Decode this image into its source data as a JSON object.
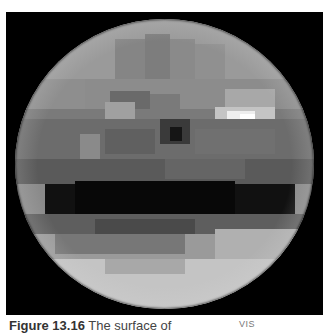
{
  "figure": {
    "label": "Figure 13.16",
    "caption_text": " The surface of",
    "tag": "VIS",
    "image_description": "Pixelated grayscale reconstruction of a planetary surface (sphere) on black background",
    "colors": {
      "background": "#000000",
      "page": "#ffffff",
      "caption_text": "#444444"
    }
  },
  "planet_cells": [
    {
      "x": 0,
      "y": 0,
      "w": 299,
      "h": 60,
      "c": "#9a9a9a"
    },
    {
      "x": 100,
      "y": 20,
      "w": 30,
      "h": 60,
      "c": "#858585"
    },
    {
      "x": 130,
      "y": 15,
      "w": 25,
      "h": 70,
      "c": "#7d7d7d"
    },
    {
      "x": 155,
      "y": 20,
      "w": 25,
      "h": 60,
      "c": "#8a8a8a"
    },
    {
      "x": 180,
      "y": 25,
      "w": 30,
      "h": 55,
      "c": "#909090"
    },
    {
      "x": 70,
      "y": 60,
      "w": 299,
      "h": 30,
      "c": "#8c8c8c"
    },
    {
      "x": 0,
      "y": 60,
      "w": 70,
      "h": 35,
      "c": "#8e8e8e"
    },
    {
      "x": 95,
      "y": 72,
      "w": 40,
      "h": 18,
      "c": "#6a6a6a"
    },
    {
      "x": 135,
      "y": 75,
      "w": 30,
      "h": 15,
      "c": "#7a7a7a"
    },
    {
      "x": 210,
      "y": 70,
      "w": 50,
      "h": 18,
      "c": "#a8a8a8"
    },
    {
      "x": 0,
      "y": 90,
      "w": 299,
      "h": 10,
      "c": "#7a7a7a"
    },
    {
      "x": 90,
      "y": 83,
      "w": 30,
      "h": 17,
      "c": "#a0a0a0"
    },
    {
      "x": 200,
      "y": 88,
      "w": 60,
      "h": 12,
      "c": "#c4c4c4"
    },
    {
      "x": 212,
      "y": 92,
      "w": 28,
      "h": 12,
      "c": "#eeeeee"
    },
    {
      "x": 225,
      "y": 95,
      "w": 15,
      "h": 10,
      "c": "#ffffff"
    },
    {
      "x": 0,
      "y": 100,
      "w": 299,
      "h": 40,
      "c": "#6c6c6c"
    },
    {
      "x": 145,
      "y": 100,
      "w": 30,
      "h": 25,
      "c": "#3a3a3a"
    },
    {
      "x": 155,
      "y": 108,
      "w": 12,
      "h": 14,
      "c": "#151515"
    },
    {
      "x": 65,
      "y": 115,
      "w": 20,
      "h": 30,
      "c": "#8a8a8a"
    },
    {
      "x": 90,
      "y": 110,
      "w": 50,
      "h": 25,
      "c": "#606060"
    },
    {
      "x": 180,
      "y": 110,
      "w": 80,
      "h": 25,
      "c": "#707070"
    },
    {
      "x": 0,
      "y": 140,
      "w": 299,
      "h": 25,
      "c": "#5a5a5a"
    },
    {
      "x": 150,
      "y": 140,
      "w": 80,
      "h": 20,
      "c": "#656565"
    },
    {
      "x": 30,
      "y": 165,
      "w": 250,
      "h": 30,
      "c": "#111111"
    },
    {
      "x": 60,
      "y": 162,
      "w": 160,
      "h": 40,
      "c": "#080808"
    },
    {
      "x": 0,
      "y": 195,
      "w": 299,
      "h": 20,
      "c": "#5e5e5e"
    },
    {
      "x": 80,
      "y": 200,
      "w": 100,
      "h": 25,
      "c": "#4a4a4a"
    },
    {
      "x": 0,
      "y": 215,
      "w": 299,
      "h": 25,
      "c": "#9a9a9a"
    },
    {
      "x": 40,
      "y": 215,
      "w": 130,
      "h": 20,
      "c": "#777777"
    },
    {
      "x": 200,
      "y": 210,
      "w": 99,
      "h": 30,
      "c": "#b0b0b0"
    },
    {
      "x": 0,
      "y": 240,
      "w": 299,
      "h": 50,
      "c": "#c4c4c4"
    },
    {
      "x": 90,
      "y": 240,
      "w": 80,
      "h": 15,
      "c": "#a8a8a8"
    }
  ]
}
